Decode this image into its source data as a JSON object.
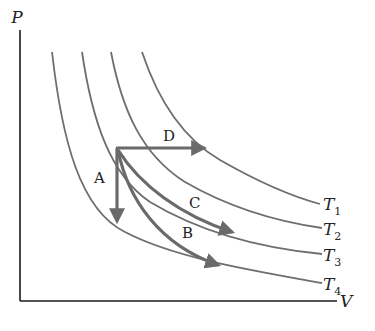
{
  "diagram": {
    "axes": {
      "y_label": "P",
      "x_label": "V"
    },
    "isotherms": [
      {
        "name": "T1",
        "label_main": "T",
        "label_sub": "1"
      },
      {
        "name": "T2",
        "label_main": "T",
        "label_sub": "2"
      },
      {
        "name": "T3",
        "label_main": "T",
        "label_sub": "3"
      },
      {
        "name": "T4",
        "label_main": "T",
        "label_sub": "4"
      }
    ],
    "processes": [
      {
        "label": "A",
        "direction": "vertical down (isochoric)"
      },
      {
        "label": "B",
        "direction": "curve down-right to T4"
      },
      {
        "label": "C",
        "direction": "curve down-right to T3"
      },
      {
        "label": "D",
        "direction": "horizontal right (isobaric)"
      }
    ],
    "colors": {
      "axis": "#1a1a1a",
      "isotherm": "#6e6e6e",
      "process": "#6a6a6a",
      "text": "#222222"
    }
  }
}
